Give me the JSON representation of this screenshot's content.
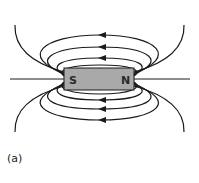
{
  "figure": {
    "label": "(a)"
  },
  "magnet": {
    "south_label": "S",
    "north_label": "N",
    "fill_color": "#a9a9a9"
  },
  "field": {
    "arrow_direction": "left",
    "line_color": "#1a1a1a"
  }
}
